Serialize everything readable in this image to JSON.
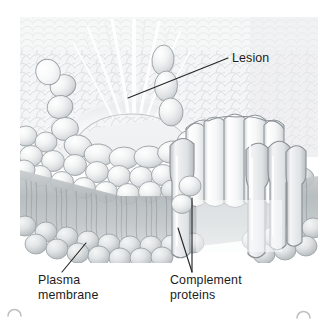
{
  "figure": {
    "background_color": "#ffffff",
    "illustration_bounds": {
      "x": 20,
      "y": 17,
      "width": 298,
      "height": 246
    },
    "style": "airbrushed grayscale biology textbook illustration"
  },
  "labels": [
    {
      "key": "lesion",
      "text": "Lesion",
      "lines": [
        "Lesion"
      ],
      "text_x": 232,
      "text_y": 62,
      "anchor": "start",
      "color": "#1c1c1c",
      "leader": {
        "x1": 228,
        "y1": 58,
        "x2": 128,
        "y2": 98
      }
    },
    {
      "key": "plasma_membrane",
      "text": "Plasma membrane",
      "lines": [
        "Plasma",
        "membrane"
      ],
      "text_x": 38,
      "text_y": 284,
      "anchor": "start",
      "color": "#1c1c1c",
      "leader": {
        "x1": 62,
        "y1": 272,
        "x2": 86,
        "y2": 243
      }
    },
    {
      "key": "complement_proteins",
      "text": "Complement proteins",
      "lines": [
        "Complement",
        "proteins"
      ],
      "text_x": 170,
      "text_y": 284,
      "anchor": "start",
      "color": "#1c1c1c",
      "leader_a": {
        "x1": 192,
        "y1": 272,
        "x2": 178,
        "y2": 228
      },
      "leader_b": {
        "x1": 192,
        "y1": 272,
        "x2": 192,
        "y2": 198
      }
    }
  ],
  "colors": {
    "label_text": "#1c1c1c",
    "leader_line": "#262626",
    "lipid_head_light": "#f7f8f8",
    "lipid_head_mid": "#dfe2e3",
    "lipid_head_shadow": "#b9bec1",
    "lipid_outline": "#9aa0a3",
    "tail_region": "#b4babd",
    "tail_strand": "#8e9498",
    "protein_fill": "#f4f5f6",
    "protein_outline": "#8b9195",
    "pore_glow": "#ffffff",
    "top_surface": "#f2f3f4",
    "corner_mark": "#8d8d8d"
  },
  "structures": {
    "top_surface": {
      "name": "membrane top surface",
      "description": "scale-like pattern of phospholipid heads seen from above"
    },
    "lesion_pore": {
      "name": "lesion",
      "description": "funnel shaped opening with radiating white highlight streaks"
    },
    "bilayer": {
      "name": "phospholipid bilayer",
      "description": "two leaflets of spherical heads with hydrocarbon tails between"
    },
    "mac_barrel": {
      "name": "complement protein barrel",
      "description": "cylinder of elongated subunits spanning the membrane"
    }
  },
  "corner_marks": [
    {
      "key": "bottom-left",
      "cx": 14,
      "cy": 313
    },
    {
      "key": "bottom-right",
      "cx": 303,
      "cy": 315
    }
  ]
}
